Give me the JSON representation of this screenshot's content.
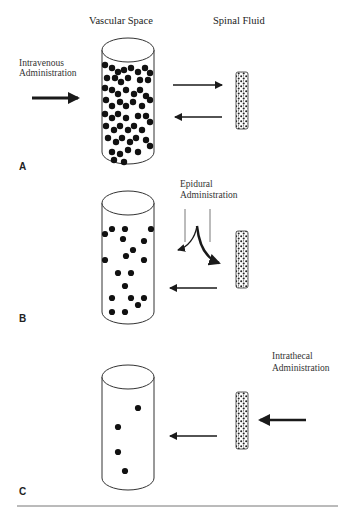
{
  "figure": {
    "headers": {
      "left": "Vascular Space",
      "right": "Spinal Fluid"
    },
    "panels": [
      {
        "id": "A",
        "label": "A",
        "route_line1": "Intravenous",
        "route_line2": "Administration",
        "description": "Drug injected into vascular space; dense particles; bidirectional exchange with spinal fluid"
      },
      {
        "id": "B",
        "label": "B",
        "route_line1": "Epidural",
        "route_line2": "Administration",
        "description": "Drug placed epidurally; splits into vascular space and spinal fluid; moderate particles"
      },
      {
        "id": "C",
        "label": "C",
        "route_line1": "Intrathecal",
        "route_line2": "Administration",
        "description": "Drug injected into spinal fluid; few particles in vascular space"
      }
    ],
    "colors": {
      "ink": "#1a1a1a",
      "text": "#333333",
      "rule": "#777777",
      "background": "#ffffff"
    }
  }
}
